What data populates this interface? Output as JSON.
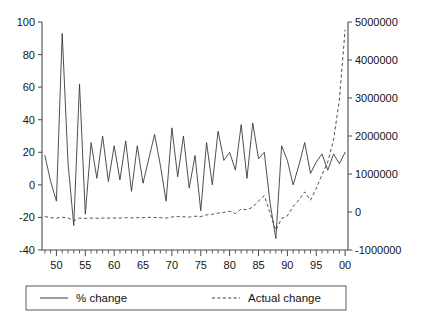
{
  "chart_data": {
    "type": "line",
    "title": "",
    "xlabel": "",
    "ylabel": "",
    "grid": false,
    "legend_position": "bottom",
    "x": [
      1948,
      1949,
      1950,
      1951,
      1952,
      1953,
      1954,
      1955,
      1956,
      1957,
      1958,
      1959,
      1960,
      1961,
      1962,
      1963,
      1964,
      1965,
      1966,
      1967,
      1968,
      1969,
      1970,
      1971,
      1972,
      1973,
      1974,
      1975,
      1976,
      1977,
      1978,
      1979,
      1980,
      1981,
      1982,
      1983,
      1984,
      1985,
      1986,
      1987,
      1988,
      1989,
      1990,
      1991,
      1992,
      1993,
      1994,
      1995,
      1996,
      1997,
      1998,
      1999,
      2000
    ],
    "x_tick_labels": [
      "50",
      "55",
      "60",
      "65",
      "70",
      "75",
      "80",
      "85",
      "90",
      "95",
      "00"
    ],
    "x_tick_values": [
      1950,
      1955,
      1960,
      1965,
      1970,
      1975,
      1980,
      1985,
      1990,
      1995,
      2000
    ],
    "x_minor_tick_step": 1,
    "xlim": [
      1947.5,
      2000.5
    ],
    "left_axis": {
      "label": "% change",
      "ylim": [
        -40,
        100
      ],
      "ticks": [
        -40,
        -20,
        0,
        20,
        40,
        60,
        80,
        100
      ],
      "tick_labels": [
        "-40",
        "-20",
        "0",
        "20",
        "40",
        "60",
        "80",
        "100"
      ]
    },
    "right_axis": {
      "label": "Actual change",
      "ylim": [
        -1000000,
        5000000
      ],
      "ticks": [
        -1000000,
        0,
        1000000,
        2000000,
        3000000,
        4000000,
        5000000
      ],
      "tick_labels": [
        "-1000000",
        "0",
        "1000000",
        "2000000",
        "3000000",
        "4000000",
        "5000000"
      ]
    },
    "series": [
      {
        "name": "% change",
        "style": "solid",
        "axis": "left",
        "color": "#3b3b3b",
        "values": [
          18,
          2,
          -10,
          93,
          14,
          -25,
          62,
          -18,
          26,
          4,
          30,
          2,
          24,
          3,
          27,
          -4,
          24,
          1,
          16,
          31,
          12,
          -10,
          35,
          5,
          30,
          -2,
          18,
          -16,
          26,
          0,
          33,
          15,
          20,
          9,
          37,
          4,
          38,
          16,
          20,
          -11,
          -33,
          24,
          15,
          0,
          12,
          26,
          7,
          14,
          19,
          9,
          19,
          13,
          20
        ]
      },
      {
        "name": "Actual change",
        "style": "dashed",
        "axis": "right",
        "color": "#3b3b3b",
        "values": [
          -120000,
          -150000,
          -160000,
          -140000,
          -150000,
          -230000,
          -160000,
          -170000,
          -160000,
          -165000,
          -160000,
          -160000,
          -158000,
          -160000,
          -150000,
          -155000,
          -150000,
          -150000,
          -140000,
          -145000,
          -150000,
          -160000,
          -130000,
          -120000,
          -125000,
          -135000,
          -110000,
          -120000,
          -75000,
          -60000,
          -30000,
          -10000,
          20000,
          -40000,
          80000,
          55000,
          130000,
          290000,
          430000,
          -20000,
          -480000,
          -170000,
          -100000,
          140000,
          320000,
          530000,
          310000,
          620000,
          980000,
          1320000,
          1900000,
          2950000,
          4800000
        ]
      }
    ]
  },
  "legend": {
    "entries": [
      {
        "label": "% change",
        "style": "solid"
      },
      {
        "label": "Actual change",
        "style": "dashed"
      }
    ]
  }
}
